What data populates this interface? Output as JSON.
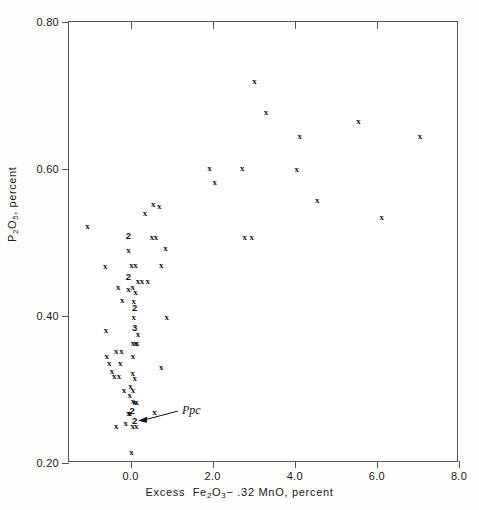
{
  "chart_data": {
    "type": "scatter",
    "title": "",
    "xlabel": "Excess Fe2O3 - .32 MnO, percent",
    "ylabel": "P2O5, percent",
    "xlim": [
      -1.5,
      8.0
    ],
    "ylim": [
      0.2,
      0.8
    ],
    "xticks": [
      "0.0",
      "2.0",
      "4.0",
      "6.0",
      "8.0"
    ],
    "xtick_values": [
      0.0,
      2.0,
      4.0,
      6.0,
      8.0
    ],
    "yticks": [
      "0.20",
      "0.40",
      "0.60",
      "0.80"
    ],
    "ytick_values": [
      0.2,
      0.4,
      0.6,
      0.8
    ],
    "grid": false,
    "legend": null,
    "marker": "x",
    "note": "Digits such as 2 and 3 denote that many coincident points at that location",
    "annotations": [
      {
        "text": "Ppc",
        "x": 1.25,
        "y": 0.272,
        "arrow_to_x": 0.18,
        "arrow_to_y": 0.2575
      }
    ],
    "points": [
      {
        "x": -1.05,
        "y": 0.523,
        "n": 1,
        "label": "x"
      },
      {
        "x": -0.62,
        "y": 0.468,
        "n": 1,
        "label": "x"
      },
      {
        "x": -0.6,
        "y": 0.381,
        "n": 1,
        "label": "x"
      },
      {
        "x": -0.58,
        "y": 0.345,
        "n": 1,
        "label": "x"
      },
      {
        "x": -0.52,
        "y": 0.336,
        "n": 1,
        "label": "x"
      },
      {
        "x": -0.45,
        "y": 0.325,
        "n": 1,
        "label": "x"
      },
      {
        "x": -0.4,
        "y": 0.318,
        "n": 1,
        "label": "x"
      },
      {
        "x": -0.35,
        "y": 0.352,
        "n": 1,
        "label": "x"
      },
      {
        "x": -0.3,
        "y": 0.44,
        "n": 1,
        "label": "x"
      },
      {
        "x": -0.28,
        "y": 0.318,
        "n": 1,
        "label": "x"
      },
      {
        "x": -0.25,
        "y": 0.336,
        "n": 1,
        "label": "x"
      },
      {
        "x": -0.22,
        "y": 0.352,
        "n": 1,
        "label": "x"
      },
      {
        "x": -0.2,
        "y": 0.422,
        "n": 1,
        "label": "x"
      },
      {
        "x": -0.16,
        "y": 0.3,
        "n": 1,
        "label": "x"
      },
      {
        "x": -0.12,
        "y": 0.255,
        "n": 1,
        "label": "x"
      },
      {
        "x": -0.05,
        "y": 0.51,
        "n": 2,
        "label": "2"
      },
      {
        "x": -0.05,
        "y": 0.49,
        "n": 1,
        "label": "x"
      },
      {
        "x": -0.05,
        "y": 0.455,
        "n": 2,
        "label": "2"
      },
      {
        "x": -0.05,
        "y": 0.437,
        "n": 1,
        "label": "x"
      },
      {
        "x": 0.02,
        "y": 0.47,
        "n": 1,
        "label": "x"
      },
      {
        "x": 0.05,
        "y": 0.44,
        "n": 1,
        "label": "x"
      },
      {
        "x": 0.08,
        "y": 0.42,
        "n": 1,
        "label": "x"
      },
      {
        "x": 0.1,
        "y": 0.412,
        "n": 2,
        "label": "2"
      },
      {
        "x": 0.08,
        "y": 0.398,
        "n": 1,
        "label": "x"
      },
      {
        "x": 0.1,
        "y": 0.385,
        "n": 3,
        "label": "3"
      },
      {
        "x": 0.18,
        "y": 0.375,
        "n": 1,
        "label": "x"
      },
      {
        "x": 0.16,
        "y": 0.363,
        "n": 1,
        "label": "x"
      },
      {
        "x": 0.12,
        "y": 0.363,
        "n": 1,
        "label": "x"
      },
      {
        "x": 0.06,
        "y": 0.363,
        "n": 1,
        "label": "x"
      },
      {
        "x": 0.12,
        "y": 0.432,
        "n": 1,
        "label": "x"
      },
      {
        "x": 0.12,
        "y": 0.47,
        "n": 1,
        "label": "x"
      },
      {
        "x": 0.18,
        "y": 0.448,
        "n": 1,
        "label": "x"
      },
      {
        "x": 0.28,
        "y": 0.448,
        "n": 1,
        "label": "x"
      },
      {
        "x": 0.42,
        "y": 0.448,
        "n": 1,
        "label": "x"
      },
      {
        "x": 0.06,
        "y": 0.345,
        "n": 1,
        "label": "x"
      },
      {
        "x": 0.05,
        "y": 0.322,
        "n": 1,
        "label": "x"
      },
      {
        "x": 0.1,
        "y": 0.316,
        "n": 1,
        "label": "x"
      },
      {
        "x": 0.0,
        "y": 0.305,
        "n": 1,
        "label": "x"
      },
      {
        "x": 0.06,
        "y": 0.3,
        "n": 1,
        "label": "x"
      },
      {
        "x": -0.02,
        "y": 0.292,
        "n": 1,
        "label": "x"
      },
      {
        "x": 0.06,
        "y": 0.285,
        "n": 1,
        "label": "x"
      },
      {
        "x": 0.1,
        "y": 0.283,
        "n": 1,
        "label": "x"
      },
      {
        "x": 0.15,
        "y": 0.283,
        "n": 1,
        "label": "x"
      },
      {
        "x": 0.04,
        "y": 0.272,
        "n": 2,
        "label": "2"
      },
      {
        "x": -0.05,
        "y": 0.268,
        "n": 1,
        "label": "x"
      },
      {
        "x": -0.02,
        "y": 0.268,
        "n": 1,
        "label": "x"
      },
      {
        "x": 0.58,
        "y": 0.27,
        "n": 1,
        "label": "x"
      },
      {
        "x": 0.1,
        "y": 0.258,
        "n": 2,
        "label": "2"
      },
      {
        "x": 0.05,
        "y": 0.25,
        "n": 1,
        "label": "x"
      },
      {
        "x": 0.14,
        "y": 0.25,
        "n": 1,
        "label": "x"
      },
      {
        "x": -0.35,
        "y": 0.25,
        "n": 1,
        "label": "x"
      },
      {
        "x": 0.02,
        "y": 0.215,
        "n": 1,
        "label": "x"
      },
      {
        "x": 0.35,
        "y": 0.54,
        "n": 1,
        "label": "x"
      },
      {
        "x": 0.55,
        "y": 0.553,
        "n": 1,
        "label": "x"
      },
      {
        "x": 0.7,
        "y": 0.55,
        "n": 1,
        "label": "x"
      },
      {
        "x": 0.52,
        "y": 0.508,
        "n": 1,
        "label": "x"
      },
      {
        "x": 0.62,
        "y": 0.508,
        "n": 1,
        "label": "x"
      },
      {
        "x": 0.85,
        "y": 0.492,
        "n": 1,
        "label": "x"
      },
      {
        "x": 0.75,
        "y": 0.47,
        "n": 1,
        "label": "x"
      },
      {
        "x": 0.88,
        "y": 0.398,
        "n": 1,
        "label": "x"
      },
      {
        "x": 0.75,
        "y": 0.33,
        "n": 1,
        "label": "x"
      },
      {
        "x": 1.92,
        "y": 0.602,
        "n": 1,
        "label": "x"
      },
      {
        "x": 2.05,
        "y": 0.582,
        "n": 1,
        "label": "x"
      },
      {
        "x": 2.72,
        "y": 0.602,
        "n": 1,
        "label": "x"
      },
      {
        "x": 2.78,
        "y": 0.508,
        "n": 1,
        "label": "x"
      },
      {
        "x": 2.95,
        "y": 0.508,
        "n": 1,
        "label": "x"
      },
      {
        "x": 3.02,
        "y": 0.72,
        "n": 1,
        "label": "x"
      },
      {
        "x": 3.3,
        "y": 0.677,
        "n": 1,
        "label": "x"
      },
      {
        "x": 4.05,
        "y": 0.6,
        "n": 1,
        "label": "x"
      },
      {
        "x": 4.12,
        "y": 0.645,
        "n": 1,
        "label": "x"
      },
      {
        "x": 4.55,
        "y": 0.558,
        "n": 1,
        "label": "x"
      },
      {
        "x": 5.55,
        "y": 0.665,
        "n": 1,
        "label": "x"
      },
      {
        "x": 6.12,
        "y": 0.535,
        "n": 1,
        "label": "x"
      },
      {
        "x": 7.05,
        "y": 0.645,
        "n": 1,
        "label": "x"
      }
    ]
  },
  "axis": {
    "y_title_prefix": "P",
    "y_title_sub1": "2",
    "y_title_mid": "O",
    "y_title_sub2": "5",
    "y_title_suffix": ", percent",
    "x_title_w1": "Excess",
    "x_title_w2": "Fe",
    "x_title_sub1": "2",
    "x_title_w3": "O",
    "x_title_sub2": "3",
    "x_title_w4": "− .32",
    "x_title_w5": "MnO, percent"
  }
}
